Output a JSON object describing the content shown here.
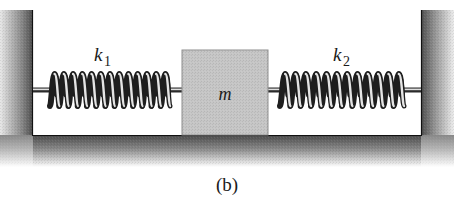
{
  "figure": {
    "caption": "(b)",
    "mass_label": "m",
    "spring_left": {
      "label_main": "k",
      "label_sub": "1",
      "coils": 13
    },
    "spring_right": {
      "label_main": "k",
      "label_sub": "2",
      "coils": 12
    },
    "colors": {
      "wall_dark": "#5a5a5a",
      "wall_light": "#f2f2f2",
      "block_fill": "#c9c9c9",
      "block_edge": "#9a9a9a",
      "spring_dark": "#2a2a2a",
      "spring_light": "#e6e6e6",
      "text": "#1a1a1a"
    }
  }
}
